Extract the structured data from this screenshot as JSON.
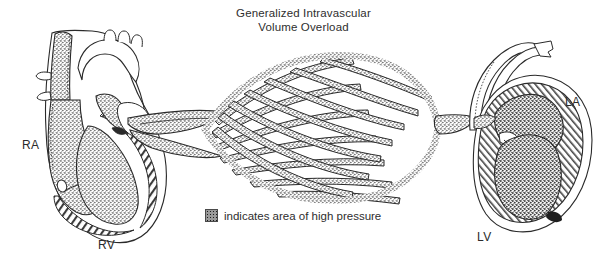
{
  "figure": {
    "title_line1": "Generalized Intravascular",
    "title_line2": "Volume Overload",
    "background_color": "#ffffff",
    "ink_color": "#2a2a2a",
    "stipple_color": "#8e8e8e",
    "labels": {
      "right_atrium": "RA",
      "right_ventricle": "RV",
      "left_atrium": "LA",
      "left_ventricle": "LV"
    },
    "legend": {
      "swatch_icon": "stipple-swatch",
      "text": "indicates area of high pressure"
    },
    "regions": [
      {
        "name": "right-heart",
        "labels": [
          "RA",
          "RV"
        ],
        "shading": "stippled-cavities-hatched-myocardium"
      },
      {
        "name": "pulmonary-capillary-bed",
        "labels": [],
        "shading": "stippled-lattice"
      },
      {
        "name": "left-heart",
        "labels": [
          "LA",
          "LV"
        ],
        "shading": "stippled-cavities-hatched-myocardium"
      }
    ]
  }
}
